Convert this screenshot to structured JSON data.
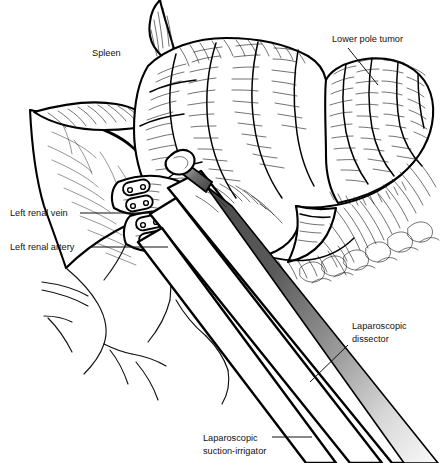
{
  "figure": {
    "kind": "medical-illustration",
    "background_color": "#ffffff",
    "ink_color": "#000000",
    "labels": [
      {
        "id": "spleen",
        "text": "Spleen",
        "x": 92,
        "y": 56,
        "leader": false
      },
      {
        "id": "tumor",
        "text": "Lower pole tumor",
        "x": 332,
        "y": 42,
        "leader": true
      },
      {
        "id": "renal-vein",
        "text": "Left renal vein",
        "x": 10,
        "y": 216,
        "leader": true
      },
      {
        "id": "renal-artery",
        "text": "Left renal artery",
        "x": 10,
        "y": 250,
        "leader": true
      },
      {
        "id": "dissector-l1",
        "text": "Laparoscopic",
        "x": 352,
        "y": 329,
        "leader": true
      },
      {
        "id": "dissector-l2",
        "text": "dissector",
        "x": 352,
        "y": 342,
        "leader": false
      },
      {
        "id": "suction-l1",
        "text": "Laparoscopic",
        "x": 203,
        "y": 441,
        "leader": true
      },
      {
        "id": "suction-l2",
        "text": "suction-irrigator",
        "x": 203,
        "y": 454,
        "leader": false
      }
    ],
    "instruments": [
      {
        "name": "laparoscopic-dissector",
        "shaft_style": "gradient-gray",
        "tip": "jawed-dissector"
      },
      {
        "name": "laparoscopic-suction-irrigator",
        "shaft_style": "white-outline",
        "tip": "blunt-cannula"
      },
      {
        "name": "retractor-shaft",
        "shaft_style": "white-outline",
        "tip": "blunt"
      }
    ],
    "anatomy": [
      {
        "name": "spleen",
        "render": "lobulated-organ-top-left"
      },
      {
        "name": "kidney",
        "render": "lobulated-organ-center"
      },
      {
        "name": "lower-pole-tumor",
        "render": "bulbous-mass-right"
      },
      {
        "name": "left-renal-vein",
        "render": "vessel-with-clips"
      },
      {
        "name": "left-renal-artery",
        "render": "vessel-with-clips"
      },
      {
        "name": "retroperitoneal-fat",
        "render": "hatched-tissue-left"
      },
      {
        "name": "aorta-branches",
        "render": "thin-line-vessels-lower-left"
      }
    ],
    "surgical_clips_count": 4,
    "gradient": {
      "dark": "#4a4a4a",
      "mid": "#8f8f8f",
      "light": "#f2f2f2"
    }
  }
}
